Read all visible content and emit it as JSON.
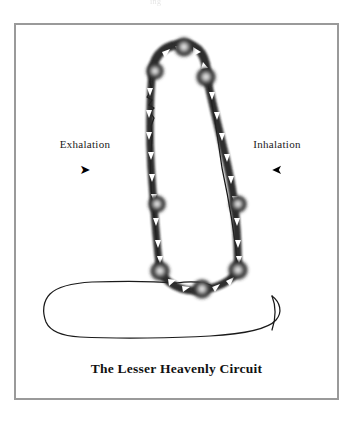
{
  "page": {
    "top_bleed_text": "ing",
    "background_color": "#ffffff"
  },
  "frame": {
    "border_color": "#9a9a9a"
  },
  "diagram": {
    "title": "The Lesser Heavenly Circuit",
    "line_color": "#1a1a1a",
    "node_color": "#3a3a3a",
    "node_core_color": "#e8e8e8",
    "arrow_mark_color": "#ffffff",
    "labels": {
      "left": {
        "text": "Exhalation",
        "arrow_glyph": "➤",
        "arrow_direction": "right"
      },
      "right": {
        "text": "Inhalation",
        "arrow_glyph": "➤",
        "arrow_direction": "left"
      }
    },
    "nodes": [
      {
        "name": "crown-point",
        "x": 184,
        "y": 48,
        "r": 9
      },
      {
        "name": "forehead-point",
        "x": 155,
        "y": 72,
        "r": 8
      },
      {
        "name": "rear-head-point",
        "x": 206,
        "y": 78,
        "r": 9
      },
      {
        "name": "front-mid-point",
        "x": 157,
        "y": 205,
        "r": 8
      },
      {
        "name": "rear-mid-point",
        "x": 238,
        "y": 205,
        "r": 8
      },
      {
        "name": "front-lower-point",
        "x": 160,
        "y": 272,
        "r": 9
      },
      {
        "name": "rear-lower-point",
        "x": 238,
        "y": 271,
        "r": 9
      },
      {
        "name": "perineum-point",
        "x": 202,
        "y": 290,
        "r": 9
      }
    ]
  },
  "caption": {
    "text": "The Lesser Heavenly Circuit"
  }
}
